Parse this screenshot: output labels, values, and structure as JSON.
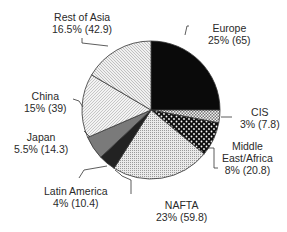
{
  "chart_data": {
    "type": "pie",
    "title": "",
    "unit_note": "percent share (value in parentheses)",
    "start_angle_deg": 0,
    "direction": "clockwise",
    "slices": [
      {
        "label": "Europe",
        "percent": 25,
        "value": 65,
        "text": "25% (65)",
        "fill": "#0a0a0a",
        "pattern": "solid"
      },
      {
        "label": "CIS",
        "percent": 3,
        "value": 7.8,
        "text": "3% (7.8)",
        "fill": "#cfcfcf",
        "pattern": "checker"
      },
      {
        "label": "Middle East/Africa",
        "percent": 8,
        "value": 20.8,
        "text": "8% (20.8)",
        "fill": "#111111",
        "pattern": "dots-white"
      },
      {
        "label": "NAFTA",
        "percent": 23,
        "value": 59.8,
        "text": "23% (59.8)",
        "fill": "#d8d8d8",
        "pattern": "fine-dots"
      },
      {
        "label": "Latin America",
        "percent": 4,
        "value": 10.4,
        "text": "4% (10.4)",
        "fill": "#222222",
        "pattern": "solid-dark"
      },
      {
        "label": "Japan",
        "percent": 5.5,
        "value": 14.3,
        "text": "5.5% (14.3)",
        "fill": "#7a7a7a",
        "pattern": "solid-gray"
      },
      {
        "label": "China",
        "percent": 15,
        "value": 39,
        "text": "15% (39)",
        "fill": "#e6e6e6",
        "pattern": "fine-hatch"
      },
      {
        "label": "Rest of Asia",
        "percent": 16.5,
        "value": 42.9,
        "text": "16.5% (42.9)",
        "fill": "#e0e0e0",
        "pattern": "diag-hatch"
      }
    ],
    "legend": "none (leader-line labels)"
  },
  "labels": {
    "europe": {
      "name": "Europe",
      "value": "25% (65)"
    },
    "cis": {
      "name": "CIS",
      "value": "3% (7.8)"
    },
    "mea": {
      "name1": "Middle",
      "name2": "East/Africa",
      "value": "8% (20.8)"
    },
    "nafta": {
      "name": "NAFTA",
      "value": "23% (59.8)"
    },
    "latam": {
      "name": "Latin America",
      "value": "4% (10.4)"
    },
    "japan": {
      "name": "Japan",
      "value": "5.5% (14.3)"
    },
    "china": {
      "name": "China",
      "value": "15% (39)"
    },
    "rest_asia": {
      "name": "Rest of Asia",
      "value": "16.5% (42.9)"
    }
  }
}
